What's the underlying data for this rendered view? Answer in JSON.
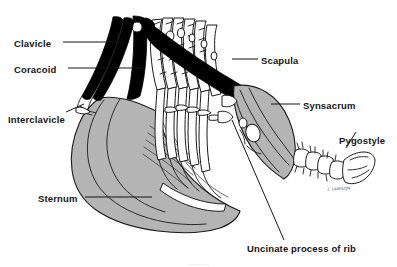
{
  "figure": {
    "background_color": "#ffffff",
    "bone_fill_color": "#b4b4b4",
    "bone_outline_color": "#1a1a1a",
    "solid_black_color": "#000000",
    "label_color": "#151515",
    "leader_line_color": "#151515",
    "artist_signature": "J. LAWSON",
    "page_footer_ghost_text": "..........."
  },
  "labels": [
    {
      "id": "clavicle",
      "text": "Clavicle",
      "x": 14,
      "y": 38,
      "leader": "horizontal-right"
    },
    {
      "id": "coracoid",
      "text": "Coracoid",
      "x": 14,
      "y": 64,
      "leader": "horizontal-right"
    },
    {
      "id": "interclavicle",
      "text": "Interclavicle",
      "x": 8,
      "y": 114,
      "leader": "diagonal-up-right"
    },
    {
      "id": "sternum",
      "text": "Sternum",
      "x": 38,
      "y": 193,
      "leader": "horizontal-right"
    },
    {
      "id": "scapula",
      "text": "Scapula",
      "x": 261,
      "y": 55,
      "leader": "horizontal-left"
    },
    {
      "id": "synsacrum",
      "text": "Synsacrum",
      "x": 303,
      "y": 100,
      "leader": "horizontal-left"
    },
    {
      "id": "pygostyle",
      "text": "Pygostyle",
      "x": 339,
      "y": 135,
      "leader": "diagonal-down-left"
    },
    {
      "id": "uncinate-process-of-rib",
      "text": "Uncinate process of rib",
      "x": 247,
      "y": 243,
      "leader": "diagonal-up-left"
    }
  ]
}
